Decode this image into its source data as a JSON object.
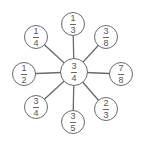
{
  "diagram": {
    "stroke_color": "#6a6a6a",
    "center": {
      "numerator": "3",
      "denominator": "4",
      "x": 74,
      "y": 72,
      "r": 14
    },
    "nodes": [
      {
        "position": "top",
        "numerator": "1",
        "denominator": "3",
        "x": 73,
        "y": 24,
        "r": 12
      },
      {
        "position": "top-right",
        "numerator": "3",
        "denominator": "8",
        "x": 106,
        "y": 37,
        "r": 12
      },
      {
        "position": "right",
        "numerator": "7",
        "denominator": "8",
        "x": 121,
        "y": 74,
        "r": 12
      },
      {
        "position": "bottom-right",
        "numerator": "2",
        "denominator": "3",
        "x": 106,
        "y": 109,
        "r": 12
      },
      {
        "position": "bottom",
        "numerator": "3",
        "denominator": "5",
        "x": 73,
        "y": 122,
        "r": 12
      },
      {
        "position": "bottom-left",
        "numerator": "3",
        "denominator": "4",
        "x": 36,
        "y": 107,
        "r": 12
      },
      {
        "position": "left",
        "numerator": "1",
        "denominator": "2",
        "x": 24,
        "y": 74,
        "r": 12
      },
      {
        "position": "top-left",
        "numerator": "1",
        "denominator": "4",
        "x": 36,
        "y": 37,
        "r": 12
      }
    ]
  }
}
